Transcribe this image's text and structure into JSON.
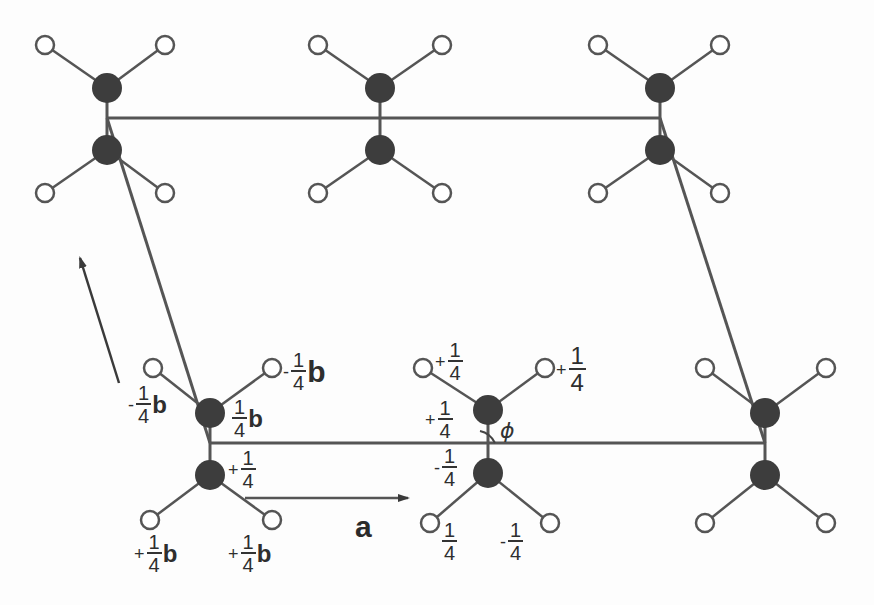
{
  "figure": {
    "colors": {
      "line": "#555555",
      "carbon": "#3d3d3d",
      "hydrogen_fill": "#ffffff",
      "hydrogen_stroke": "#555555"
    }
  },
  "axes": {
    "a_label": "a",
    "angle_label": "ϕ"
  },
  "unit_cell": {
    "corners": [
      [
        107,
        118
      ],
      [
        660,
        118
      ],
      [
        765,
        443
      ],
      [
        210,
        443
      ]
    ]
  },
  "molecules": [
    {
      "id": "top-left",
      "c1": [
        107,
        88
      ],
      "c2": [
        107,
        150
      ],
      "h": [
        [
          45,
          45
        ],
        [
          165,
          45
        ],
        [
          45,
          193
        ],
        [
          165,
          193
        ]
      ]
    },
    {
      "id": "top-middle",
      "c1": [
        380,
        88
      ],
      "c2": [
        380,
        150
      ],
      "h": [
        [
          318,
          45
        ],
        [
          442,
          45
        ],
        [
          318,
          193
        ],
        [
          442,
          193
        ]
      ]
    },
    {
      "id": "top-right",
      "c1": [
        660,
        88
      ],
      "c2": [
        660,
        150
      ],
      "h": [
        [
          598,
          45
        ],
        [
          720,
          45
        ],
        [
          598,
          193
        ],
        [
          720,
          193
        ]
      ]
    },
    {
      "id": "bottom-left",
      "c1": [
        210,
        413
      ],
      "c2": [
        210,
        475
      ],
      "h": [
        [
          153,
          368
        ],
        [
          272,
          368
        ],
        [
          150,
          520
        ],
        [
          272,
          520
        ]
      ]
    },
    {
      "id": "bottom-middle",
      "c1": [
        488,
        410
      ],
      "c2": [
        488,
        473
      ],
      "h": [
        [
          423,
          368
        ],
        [
          545,
          368
        ],
        [
          430,
          523
        ],
        [
          550,
          523
        ]
      ]
    },
    {
      "id": "bottom-right",
      "c1": [
        765,
        413
      ],
      "c2": [
        765,
        475
      ],
      "h": [
        [
          705,
          368
        ],
        [
          826,
          368
        ],
        [
          705,
          523
        ],
        [
          826,
          523
        ]
      ]
    }
  ],
  "labels": {
    "bl_h_upper_left": {
      "sign": "-",
      "num": "1",
      "den": "4",
      "unit": "b"
    },
    "bl_h_upper_right": {
      "sign": "-",
      "num": "1",
      "den": "4",
      "unit": "b"
    },
    "bl_c_upper": {
      "sign": "",
      "num": "1",
      "den": "4",
      "unit": "b"
    },
    "bl_c_lower": {
      "sign": "+",
      "num": "1",
      "den": "4",
      "unit": ""
    },
    "bl_h_lower_left": {
      "sign": "+",
      "num": "1",
      "den": "4",
      "unit": "b"
    },
    "bl_h_lower_right": {
      "sign": "+",
      "num": "1",
      "den": "4",
      "unit": "b"
    },
    "bm_h_upper_left": {
      "sign": "+",
      "num": "1",
      "den": "4",
      "unit": ""
    },
    "bm_h_upper_right": {
      "sign": "+",
      "num": "1",
      "den": "4",
      "unit": ""
    },
    "bm_c_upper": {
      "sign": "+",
      "num": "1",
      "den": "4",
      "unit": ""
    },
    "bm_c_lower": {
      "sign": "-",
      "num": "1",
      "den": "4",
      "unit": ""
    },
    "bm_h_lower_left": {
      "sign": "",
      "num": "1",
      "den": "4",
      "unit": ""
    },
    "bm_h_lower_right": {
      "sign": "-",
      "num": "1",
      "den": "4",
      "unit": ""
    }
  }
}
